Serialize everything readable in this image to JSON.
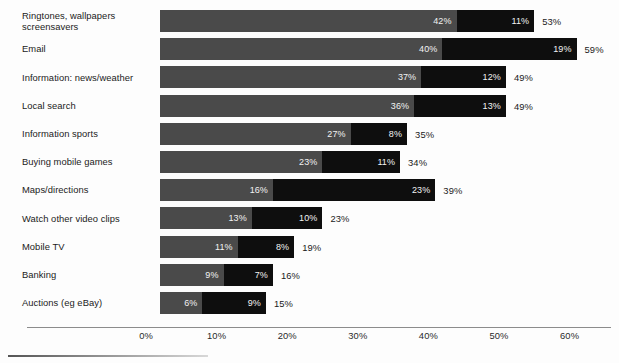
{
  "chart_data": {
    "type": "bar",
    "orientation": "horizontal",
    "stacked": true,
    "title": "",
    "xlabel": "",
    "ylabel": "",
    "xlim": [
      0,
      62
    ],
    "xticks": [
      "0%",
      "10%",
      "20%",
      "30%",
      "40%",
      "50%",
      "60%"
    ],
    "xtick_values": [
      0,
      10,
      20,
      30,
      40,
      50,
      60
    ],
    "grid": false,
    "legend": "none",
    "categories": [
      "Ringtones, wallpapers\nscreensavers",
      "Email",
      "Information: news/weather",
      "Local search",
      "Information sports",
      "Buying mobile games",
      "Maps/directions",
      "Watch other video clips",
      "Mobile TV",
      "Banking",
      "Auctions (eg eBay)"
    ],
    "series": [
      {
        "name": "segment-1",
        "color": "#4a4a4a",
        "values": [
          42,
          40,
          37,
          36,
          27,
          23,
          16,
          13,
          11,
          9,
          6
        ],
        "labels": [
          "42%",
          "40%",
          "37%",
          "36%",
          "27%",
          "23%",
          "16%",
          "13%",
          "11%",
          "9%",
          "6%"
        ]
      },
      {
        "name": "segment-2",
        "color": "#0e0e0e",
        "values": [
          11,
          19,
          12,
          13,
          8,
          11,
          23,
          10,
          8,
          7,
          9
        ],
        "labels": [
          "11%",
          "19%",
          "12%",
          "13%",
          "8%",
          "11%",
          "23%",
          "10%",
          "8%",
          "7%",
          "9%"
        ]
      }
    ],
    "totals": [
      53,
      59,
      49,
      49,
      35,
      34,
      39,
      23,
      19,
      16,
      15
    ],
    "total_labels": [
      "53%",
      "59%",
      "49%",
      "49%",
      "35%",
      "34%",
      "39%",
      "23%",
      "19%",
      "16%",
      "15%"
    ]
  }
}
